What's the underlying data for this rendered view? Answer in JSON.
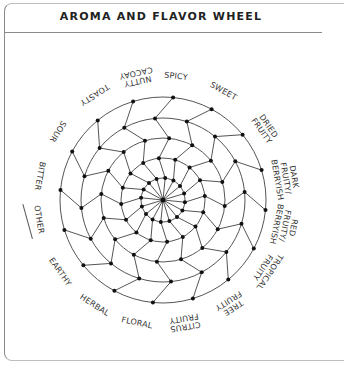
{
  "title": "AROMA AND FLAVOR WHEEL",
  "wheel": {
    "center": [
      163,
      200
    ],
    "radii": [
      22,
      42,
      62,
      82,
      103
    ],
    "spokes": 16,
    "line_color": "#555555",
    "dot_color": "#111111"
  },
  "categories": [
    {
      "label": [
        "SPICY"
      ],
      "angle": -84
    },
    {
      "label": [
        "SWEET"
      ],
      "angle": -61
    },
    {
      "label": [
        "DRIED",
        "FRUITY"
      ],
      "angle": -35
    },
    {
      "label": [
        "DARK",
        "FRUITY/",
        "BERRYISH"
      ],
      "angle": -10
    },
    {
      "label": [
        "RED",
        "FRUITY/",
        "BERRYISH"
      ],
      "angle": 12
    },
    {
      "label": [
        "TROPICAL",
        "FRUITY"
      ],
      "angle": 34
    },
    {
      "label": [
        "TREE",
        "FRUITY"
      ],
      "angle": 57
    },
    {
      "label": [
        "CITRUS",
        "FRUITY"
      ],
      "angle": 80
    },
    {
      "label": [
        "FLORAL"
      ],
      "angle": 102
    },
    {
      "label": [
        "HERBAL"
      ],
      "angle": 123
    },
    {
      "label": [
        "EARTHY"
      ],
      "angle": 145
    },
    {
      "label": [
        "OTHER"
      ],
      "angle": 171,
      "underline": true
    },
    {
      "label": [
        "BITTER"
      ],
      "angle": 191
    },
    {
      "label": [
        "SOUR"
      ],
      "angle": 213
    },
    {
      "label": [
        "TOASTY"
      ],
      "angle": 237
    },
    {
      "label": [
        "NUTTY",
        "CACOAY"
      ],
      "angle": 258
    }
  ]
}
